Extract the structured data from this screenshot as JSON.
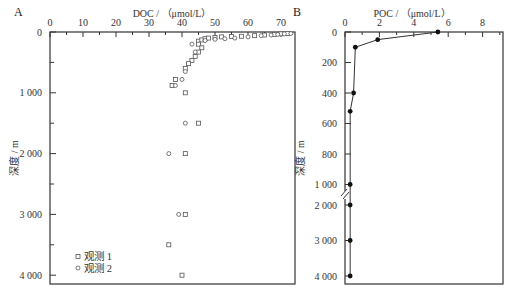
{
  "chart_data": [
    {
      "panel": "A",
      "type": "scatter",
      "title": "",
      "xlabel": "DOC / （μmol/L）",
      "ylabel": "深度 / m",
      "xlim": [
        0,
        74
      ],
      "ylim": [
        4150,
        0
      ],
      "x_ticks": [
        0,
        10,
        20,
        30,
        40,
        50,
        60,
        70
      ],
      "y_ticks": [
        0,
        1000,
        2000,
        3000,
        4000
      ],
      "y_tick_labels": [
        "0",
        "1 000",
        "2 000",
        "3 000",
        "4 000"
      ],
      "legend": [
        {
          "label": "观测 1",
          "marker": "square"
        },
        {
          "label": "观测 2",
          "marker": "circle"
        }
      ],
      "legend_position": "lower left",
      "grid": false,
      "series": [
        {
          "name": "观测 1",
          "marker": "square",
          "points": [
            [
              45,
              150
            ],
            [
              46,
              130
            ],
            [
              47,
              110
            ],
            [
              48,
              100
            ],
            [
              50,
              90
            ],
            [
              52,
              80
            ],
            [
              55,
              75
            ],
            [
              58,
              70
            ],
            [
              62,
              60
            ],
            [
              65,
              50
            ],
            [
              68,
              40
            ],
            [
              70,
              30
            ],
            [
              72,
              25
            ],
            [
              45,
              200
            ],
            [
              46,
              260
            ],
            [
              45,
              330
            ],
            [
              44,
              400
            ],
            [
              43,
              470
            ],
            [
              42,
              520
            ],
            [
              41,
              600
            ],
            [
              38,
              780
            ],
            [
              37,
              880
            ],
            [
              41,
              1000
            ],
            [
              45,
              1500
            ],
            [
              41,
              2000
            ],
            [
              41,
              3000
            ],
            [
              36,
              3500
            ],
            [
              40,
              4000
            ]
          ]
        },
        {
          "name": "观测 2",
          "marker": "circle",
          "points": [
            [
              43,
              200
            ],
            [
              47,
              140
            ],
            [
              50,
              120
            ],
            [
              53,
              110
            ],
            [
              56,
              100
            ],
            [
              60,
              80
            ],
            [
              64,
              60
            ],
            [
              67,
              50
            ],
            [
              69,
              40
            ],
            [
              71,
              30
            ],
            [
              73,
              25
            ],
            [
              44,
              330
            ],
            [
              41,
              650
            ],
            [
              40,
              780
            ],
            [
              38,
              880
            ],
            [
              41,
              1500
            ],
            [
              36,
              2000
            ],
            [
              39,
              3000
            ]
          ]
        }
      ]
    },
    {
      "panel": "B",
      "type": "line",
      "title": "",
      "xlabel": "POC / （μmol/L）",
      "ylabel": "深度 / m",
      "xlim": [
        0,
        9.2
      ],
      "ylim": [
        4100,
        0
      ],
      "x_ticks": [
        0,
        2,
        4,
        6,
        8
      ],
      "y_ticks": [
        0,
        200,
        400,
        600,
        800,
        1000,
        2000,
        3000,
        4000
      ],
      "y_tick_labels": [
        "0",
        "200",
        "400",
        "600",
        "800",
        "1 000",
        "2 000",
        "3 000",
        "4 000"
      ],
      "axis_break": "between 1 000 and 2 000",
      "grid": false,
      "series": [
        {
          "name": "POC",
          "marker": "filled-circle",
          "points": [
            [
              5.4,
              0
            ],
            [
              1.9,
              50
            ],
            [
              0.6,
              100
            ],
            [
              0.5,
              400
            ],
            [
              0.3,
              520
            ],
            [
              0.3,
              1000
            ],
            [
              0.3,
              2000
            ],
            [
              0.3,
              3000
            ],
            [
              0.3,
              4000
            ]
          ]
        }
      ]
    }
  ],
  "panels": {
    "A": {
      "label": "A",
      "xlabel": "DOC / （μmol/L）",
      "ylabel": "深度 / m",
      "x_tick_labels": [
        "0",
        "10",
        "20",
        "30",
        "40",
        "50",
        "60",
        "70"
      ],
      "y_tick_labels": [
        "0",
        "1 000",
        "2 000",
        "3 000",
        "4 000"
      ],
      "legend": [
        "观测 1",
        "观测 2"
      ]
    },
    "B": {
      "label": "B",
      "xlabel": "POC / （μmol/L）",
      "ylabel": "深度 / m",
      "x_tick_labels": [
        "0",
        "2",
        "4",
        "6",
        "8"
      ],
      "y_tick_labels": [
        "0",
        "200",
        "400",
        "600",
        "800",
        "1 000",
        "2 000",
        "3 000",
        "4 000"
      ]
    }
  },
  "colors": {
    "axis": "#333333",
    "marker": "#555555",
    "line": "#333333",
    "fill": "#111111"
  }
}
